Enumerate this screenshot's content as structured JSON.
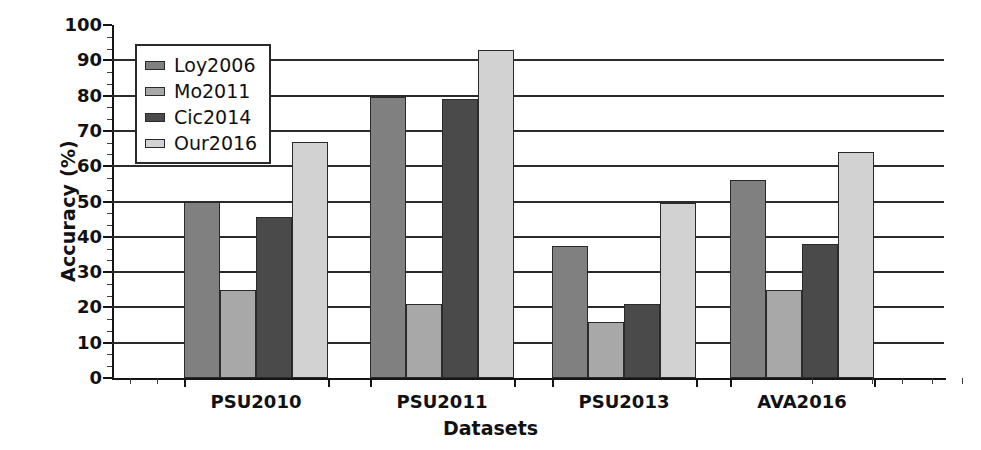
{
  "chart_data": {
    "type": "bar",
    "title": "",
    "xlabel": "Datasets",
    "ylabel": "Accuracy (%)",
    "categories": [
      "PSU2010",
      "PSU2011",
      "PSU2013",
      "AVA2016"
    ],
    "series": [
      {
        "name": "Loy2006",
        "color": "#808080",
        "values": [
          50,
          79.5,
          37.5,
          56
        ]
      },
      {
        "name": "Mo2011",
        "color": "#a8a8a8",
        "values": [
          25,
          21,
          16,
          25
        ]
      },
      {
        "name": "Cic2014",
        "color": "#4a4a4a",
        "values": [
          45.5,
          79,
          21,
          38
        ]
      },
      {
        "name": "Our2016",
        "color": "#d2d2d2",
        "values": [
          67,
          93,
          49.5,
          64
        ]
      }
    ],
    "ylim": [
      0,
      100
    ],
    "ytick_step": 10,
    "yticks": [
      0,
      10,
      20,
      30,
      40,
      50,
      60,
      70,
      80,
      90,
      100
    ],
    "ytick_labels": [
      "0",
      "10",
      "20",
      "30",
      "40",
      "50",
      "60",
      "70",
      "80",
      "90",
      "100"
    ],
    "grid": true,
    "grid_axis": "y",
    "legend_position": "upper-left",
    "legend_entries": [
      "Loy2006",
      "Mo2011",
      "Cic2014",
      "Our2016"
    ],
    "minor_ticks_per_interval": 2,
    "bar_edge_color": "#2a2a2a",
    "axis_color": "#151515"
  }
}
